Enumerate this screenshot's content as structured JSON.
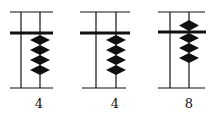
{
  "diagram": {
    "type": "abacus",
    "colors": {
      "ink": "#111111",
      "background": "#ffffff"
    },
    "rods": [
      {
        "label": "4",
        "upper_beads_at_bar": 0,
        "lower_beads_at_bar": 4
      },
      {
        "label": "4",
        "upper_beads_at_bar": 0,
        "lower_beads_at_bar": 4
      },
      {
        "label": "8",
        "upper_beads_at_bar": 1,
        "lower_beads_at_bar": 3
      }
    ]
  }
}
